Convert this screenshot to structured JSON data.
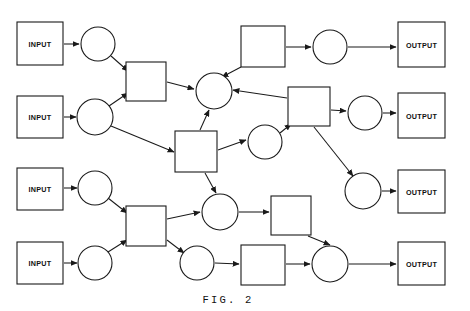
{
  "figure": {
    "caption": "FIG. 2",
    "caption_x": 228,
    "caption_y": 300,
    "width": 470,
    "height": 311,
    "background_color": "#ffffff",
    "stroke_color": "#1a1a1a",
    "label_color": "#111111"
  },
  "chart_data": {
    "type": "diagram",
    "title": "FIG. 2",
    "subtitle": "",
    "node_shapes": [
      "rect",
      "circle"
    ],
    "nodes": [
      {
        "id": "input1",
        "shape": "rect",
        "label": "INPUT",
        "x": 17,
        "y": 22,
        "w": 46,
        "h": 43
      },
      {
        "id": "input2",
        "shape": "rect",
        "label": "INPUT",
        "x": 17,
        "y": 96,
        "w": 46,
        "h": 42
      },
      {
        "id": "input3",
        "shape": "rect",
        "label": "INPUT",
        "x": 17,
        "y": 168,
        "w": 46,
        "h": 42
      },
      {
        "id": "input4",
        "shape": "rect",
        "label": "INPUT",
        "x": 17,
        "y": 242,
        "w": 46,
        "h": 42
      },
      {
        "id": "output1",
        "shape": "rect",
        "label": "OUTPUT",
        "x": 398,
        "y": 22,
        "w": 47,
        "h": 45
      },
      {
        "id": "output2",
        "shape": "rect",
        "label": "OUTPUT",
        "x": 398,
        "y": 93,
        "w": 47,
        "h": 45
      },
      {
        "id": "output3",
        "shape": "rect",
        "label": "OUTPUT",
        "x": 398,
        "y": 170,
        "w": 47,
        "h": 43
      },
      {
        "id": "output4",
        "shape": "rect",
        "label": "OUTPUT",
        "x": 398,
        "y": 242,
        "w": 47,
        "h": 43
      },
      {
        "id": "c1",
        "shape": "circle",
        "label": "",
        "cx": 98,
        "cy": 44,
        "r": 17
      },
      {
        "id": "c2",
        "shape": "circle",
        "label": "",
        "cx": 95,
        "cy": 117,
        "r": 18
      },
      {
        "id": "c3",
        "shape": "circle",
        "label": "",
        "cx": 95,
        "cy": 188,
        "r": 17
      },
      {
        "id": "c4",
        "shape": "circle",
        "label": "",
        "cx": 95,
        "cy": 263,
        "r": 17
      },
      {
        "id": "s1",
        "shape": "rect",
        "label": "",
        "x": 126,
        "y": 62,
        "w": 40,
        "h": 39
      },
      {
        "id": "s2",
        "shape": "rect",
        "label": "",
        "x": 126,
        "y": 206,
        "w": 40,
        "h": 40
      },
      {
        "id": "chub",
        "shape": "circle",
        "label": "",
        "cx": 214,
        "cy": 91,
        "r": 18
      },
      {
        "id": "smid",
        "shape": "rect",
        "label": "",
        "x": 175,
        "y": 131,
        "w": 42,
        "h": 41
      },
      {
        "id": "cmid",
        "shape": "circle",
        "label": "",
        "cx": 265,
        "cy": 142,
        "r": 17
      },
      {
        "id": "stop",
        "shape": "rect",
        "label": "",
        "x": 241,
        "y": 26,
        "w": 44,
        "h": 41
      },
      {
        "id": "ctop",
        "shape": "circle",
        "label": "",
        "cx": 330,
        "cy": 47,
        "r": 17
      },
      {
        "id": "sr",
        "shape": "rect",
        "label": "",
        "x": 288,
        "y": 87,
        "w": 42,
        "h": 39
      },
      {
        "id": "cr",
        "shape": "circle",
        "label": "",
        "cx": 365,
        "cy": 113,
        "r": 17
      },
      {
        "id": "cr3",
        "shape": "circle",
        "label": "",
        "cx": 363,
        "cy": 191,
        "r": 18
      },
      {
        "id": "clow",
        "shape": "circle",
        "label": "",
        "cx": 220,
        "cy": 212,
        "r": 18
      },
      {
        "id": "slow",
        "shape": "rect",
        "label": "",
        "x": 271,
        "y": 196,
        "w": 40,
        "h": 39
      },
      {
        "id": "cbot",
        "shape": "circle",
        "label": "",
        "cx": 197,
        "cy": 263,
        "r": 17
      },
      {
        "id": "sbot",
        "shape": "rect",
        "label": "",
        "x": 241,
        "y": 245,
        "w": 44,
        "h": 40
      },
      {
        "id": "cbr",
        "shape": "circle",
        "label": "",
        "cx": 330,
        "cy": 264,
        "r": 18
      }
    ],
    "edges": [
      {
        "from": "input1",
        "to": "c1",
        "x1": 64,
        "y1": 44,
        "x2": 79,
        "y2": 44
      },
      {
        "from": "input2",
        "to": "c2",
        "x1": 64,
        "y1": 117,
        "x2": 76,
        "y2": 117
      },
      {
        "from": "input3",
        "to": "c3",
        "x1": 64,
        "y1": 188,
        "x2": 77,
        "y2": 188
      },
      {
        "from": "input4",
        "to": "c4",
        "x1": 64,
        "y1": 263,
        "x2": 77,
        "y2": 263
      },
      {
        "from": "c1",
        "to": "s1",
        "x1": 111,
        "y1": 56,
        "x2": 128,
        "y2": 71
      },
      {
        "from": "c2",
        "to": "s1",
        "x1": 109,
        "y1": 106,
        "x2": 128,
        "y2": 93
      },
      {
        "from": "c2",
        "to": "smid",
        "x1": 111,
        "y1": 126,
        "x2": 174,
        "y2": 152
      },
      {
        "from": "s1",
        "to": "chub",
        "x1": 167,
        "y1": 82,
        "x2": 194,
        "y2": 89
      },
      {
        "from": "smid",
        "to": "chub",
        "x1": 200,
        "y1": 130,
        "x2": 209,
        "y2": 110
      },
      {
        "from": "smid",
        "to": "cmid",
        "x1": 218,
        "y1": 150,
        "x2": 246,
        "y2": 140
      },
      {
        "from": "smid",
        "to": "clow",
        "x1": 205,
        "y1": 173,
        "x2": 216,
        "y2": 193
      },
      {
        "from": "stop",
        "to": "chub",
        "x1": 241,
        "y1": 67,
        "x2": 222,
        "y2": 77
      },
      {
        "from": "stop",
        "to": "ctop",
        "x1": 286,
        "y1": 47,
        "x2": 311,
        "y2": 47
      },
      {
        "from": "ctop",
        "to": "output1",
        "x1": 348,
        "y1": 47,
        "x2": 396,
        "y2": 47
      },
      {
        "from": "sr",
        "to": "chub",
        "x1": 287,
        "y1": 98,
        "x2": 233,
        "y2": 90
      },
      {
        "from": "cmid",
        "to": "sr",
        "x1": 280,
        "y1": 133,
        "x2": 291,
        "y2": 124
      },
      {
        "from": "sr",
        "to": "cr",
        "x1": 331,
        "y1": 110,
        "x2": 346,
        "y2": 111
      },
      {
        "from": "cr",
        "to": "output2",
        "x1": 383,
        "y1": 113,
        "x2": 396,
        "y2": 113
      },
      {
        "from": "sr",
        "to": "cr3",
        "x1": 314,
        "y1": 127,
        "x2": 353,
        "y2": 176
      },
      {
        "from": "cr3",
        "to": "output3",
        "x1": 382,
        "y1": 191,
        "x2": 396,
        "y2": 191
      },
      {
        "from": "c3",
        "to": "s2",
        "x1": 108,
        "y1": 198,
        "x2": 127,
        "y2": 213
      },
      {
        "from": "c4",
        "to": "s2",
        "x1": 108,
        "y1": 252,
        "x2": 127,
        "y2": 240
      },
      {
        "from": "s2",
        "to": "clow",
        "x1": 167,
        "y1": 219,
        "x2": 200,
        "y2": 212
      },
      {
        "from": "s2",
        "to": "cbot",
        "x1": 167,
        "y1": 240,
        "x2": 184,
        "y2": 253
      },
      {
        "from": "clow",
        "to": "slow",
        "x1": 239,
        "y1": 212,
        "x2": 269,
        "y2": 212
      },
      {
        "from": "slow",
        "to": "cbr",
        "x1": 308,
        "y1": 236,
        "x2": 330,
        "y2": 245
      },
      {
        "from": "cbot",
        "to": "sbot",
        "x1": 215,
        "y1": 263,
        "x2": 239,
        "y2": 264
      },
      {
        "from": "sbot",
        "to": "cbr",
        "x1": 286,
        "y1": 264,
        "x2": 310,
        "y2": 264
      },
      {
        "from": "cbr",
        "to": "output4",
        "x1": 349,
        "y1": 264,
        "x2": 396,
        "y2": 264
      }
    ],
    "legend": [],
    "grid": false
  }
}
